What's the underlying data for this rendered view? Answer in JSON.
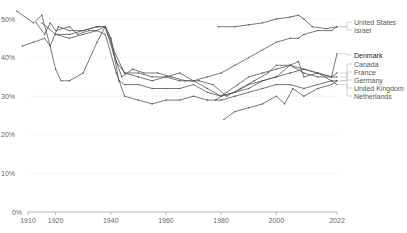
{
  "chart_data": {
    "type": "line",
    "title": "",
    "xlabel": "",
    "ylabel": "",
    "ylim": [
      0,
      52
    ],
    "xlim": [
      1905,
      2022
    ],
    "grid": true,
    "legend_position": "right-inline",
    "y_ticks": [
      "0%",
      "10%",
      "20%",
      "30%",
      "40%",
      "50%"
    ],
    "x_ticks": [
      "1910",
      "1920",
      "1940",
      "1960",
      "1980",
      "2000",
      "2022"
    ],
    "series": [
      {
        "name": "United States",
        "points": [
          [
            1913,
            49
          ],
          [
            1916,
            46
          ],
          [
            1918,
            49
          ],
          [
            1920,
            47
          ],
          [
            1925,
            48
          ],
          [
            1928,
            46
          ],
          [
            1932,
            47
          ],
          [
            1935,
            47
          ],
          [
            1938,
            48
          ],
          [
            1940,
            45
          ],
          [
            1942,
            39
          ],
          [
            1945,
            36
          ],
          [
            1950,
            36
          ],
          [
            1955,
            35
          ],
          [
            1960,
            35
          ],
          [
            1965,
            34
          ],
          [
            1970,
            34
          ],
          [
            1975,
            35
          ],
          [
            1980,
            36
          ],
          [
            1985,
            38
          ],
          [
            1990,
            40
          ],
          [
            1995,
            42
          ],
          [
            2000,
            44
          ],
          [
            2005,
            45
          ],
          [
            2008,
            45
          ],
          [
            2010,
            46
          ],
          [
            2015,
            47
          ],
          [
            2020,
            47
          ],
          [
            2022,
            48
          ]
        ]
      },
      {
        "name": "Israel",
        "points": [
          [
            1979,
            48
          ],
          [
            1985,
            48
          ],
          [
            1990,
            48.5
          ],
          [
            1995,
            49
          ],
          [
            2000,
            50
          ],
          [
            2005,
            50.5
          ],
          [
            2008,
            51
          ],
          [
            2010,
            50
          ],
          [
            2013,
            48
          ],
          [
            2018,
            47.5
          ],
          [
            2022,
            48
          ]
        ]
      },
      {
        "name": "Denmark",
        "points": [
          [
            1908,
            43
          ],
          [
            1912,
            44
          ],
          [
            1916,
            45
          ],
          [
            1918,
            43
          ],
          [
            1920,
            37
          ],
          [
            1922,
            34
          ],
          [
            1925,
            34
          ],
          [
            1930,
            36
          ],
          [
            1935,
            44
          ],
          [
            1938,
            48
          ],
          [
            1940,
            45
          ],
          [
            1943,
            34
          ],
          [
            1945,
            33
          ],
          [
            1950,
            33
          ],
          [
            1955,
            32
          ],
          [
            1960,
            32
          ],
          [
            1965,
            32
          ],
          [
            1970,
            33
          ],
          [
            1975,
            31
          ],
          [
            1980,
            30
          ],
          [
            1985,
            31
          ],
          [
            1990,
            32
          ],
          [
            1995,
            34
          ],
          [
            2000,
            35
          ],
          [
            2005,
            36
          ],
          [
            2010,
            37
          ],
          [
            2015,
            36
          ],
          [
            2020,
            35
          ],
          [
            2022,
            41
          ]
        ]
      },
      {
        "name": "Canada",
        "points": [
          [
            1920,
            46
          ],
          [
            1925,
            46
          ],
          [
            1930,
            47
          ],
          [
            1935,
            48
          ],
          [
            1938,
            48
          ],
          [
            1941,
            41
          ],
          [
            1944,
            35
          ],
          [
            1948,
            37
          ],
          [
            1952,
            36
          ],
          [
            1957,
            36
          ],
          [
            1962,
            35
          ],
          [
            1967,
            34
          ],
          [
            1972,
            34
          ],
          [
            1977,
            33
          ],
          [
            1982,
            30
          ],
          [
            1987,
            32
          ],
          [
            1992,
            34
          ],
          [
            1997,
            36
          ],
          [
            2000,
            38
          ],
          [
            2005,
            38
          ],
          [
            2010,
            36
          ],
          [
            2015,
            35
          ],
          [
            2020,
            35
          ],
          [
            2022,
            35
          ]
        ]
      },
      {
        "name": "France",
        "points": [
          [
            1915,
            49
          ],
          [
            1920,
            46
          ],
          [
            1925,
            45
          ],
          [
            1930,
            46
          ],
          [
            1935,
            47
          ],
          [
            1938,
            46
          ],
          [
            1942,
            36
          ],
          [
            1945,
            30
          ],
          [
            1950,
            29
          ],
          [
            1955,
            28
          ],
          [
            1960,
            29
          ],
          [
            1965,
            29
          ],
          [
            1970,
            30
          ],
          [
            1975,
            29
          ],
          [
            1980,
            29
          ],
          [
            1985,
            30
          ],
          [
            1990,
            31
          ],
          [
            1995,
            32
          ],
          [
            2000,
            33
          ],
          [
            2005,
            33
          ],
          [
            2010,
            32
          ],
          [
            2015,
            33
          ],
          [
            2020,
            34
          ],
          [
            2022,
            34
          ]
        ]
      },
      {
        "name": "Germany",
        "points": [
          [
            1906,
            52
          ],
          [
            1912,
            49
          ],
          [
            1915,
            51
          ],
          [
            1918,
            43
          ],
          [
            1921,
            48
          ],
          [
            1925,
            47
          ],
          [
            1930,
            47
          ],
          [
            1935,
            48
          ],
          [
            1938,
            48
          ],
          [
            1941,
            42
          ],
          [
            1945,
            36
          ],
          [
            1950,
            35
          ],
          [
            1955,
            34
          ],
          [
            1960,
            35
          ],
          [
            1965,
            36
          ],
          [
            1970,
            34
          ],
          [
            1975,
            32
          ],
          [
            1980,
            30
          ],
          [
            1985,
            31
          ],
          [
            1990,
            33
          ],
          [
            1995,
            34
          ],
          [
            2000,
            35
          ],
          [
            2005,
            38
          ],
          [
            2010,
            37
          ],
          [
            2015,
            36
          ],
          [
            2020,
            35
          ],
          [
            2022,
            36
          ]
        ]
      },
      {
        "name": "United Kingdom",
        "points": [
          [
            1978,
            29
          ],
          [
            1982,
            31
          ],
          [
            1986,
            33
          ],
          [
            1990,
            35
          ],
          [
            1995,
            36
          ],
          [
            2000,
            37
          ],
          [
            2005,
            38
          ],
          [
            2008,
            39
          ],
          [
            2010,
            35
          ],
          [
            2015,
            36
          ],
          [
            2020,
            34
          ],
          [
            2022,
            33
          ]
        ]
      },
      {
        "name": "Netherlands",
        "points": [
          [
            1981,
            24
          ],
          [
            1985,
            26
          ],
          [
            1990,
            27
          ],
          [
            1995,
            28
          ],
          [
            2000,
            30
          ],
          [
            2003,
            28
          ],
          [
            2006,
            32
          ],
          [
            2010,
            30
          ],
          [
            2015,
            32
          ],
          [
            2020,
            33
          ],
          [
            2022,
            34
          ]
        ]
      }
    ]
  },
  "legend": {
    "labels": [
      "United States",
      "Israel",
      "Denmark",
      "Canada",
      "France",
      "Germany",
      "United Kingdom",
      "Netherlands"
    ]
  }
}
